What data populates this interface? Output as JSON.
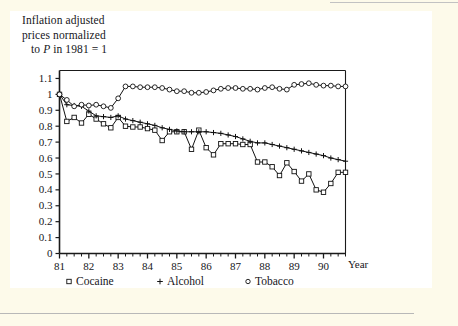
{
  "figure": {
    "axis_title_line1": "Inflation adjusted",
    "axis_title_line2": "prices normalized",
    "axis_title_line3_pre": "to ",
    "axis_title_line3_var": "P",
    "axis_title_line3_post": " in 1981 = 1",
    "x_axis_caption": "Year"
  },
  "colors": {
    "page_border": "#fdfaea",
    "page": "#ffffff",
    "ink": "#16161a",
    "line": "#111111",
    "rule": "#b8b8b8"
  },
  "chart_data": {
    "type": "line",
    "title": "Inflation adjusted prices normalized to P in 1981 = 1",
    "xlabel": "Year",
    "ylabel": "Inflation adjusted prices normalized to P in 1981 = 1",
    "xlim": [
      1981.0,
      1990.75
    ],
    "ylim": [
      0,
      1.15
    ],
    "yticks": [
      0,
      0.1,
      0.2,
      0.3,
      0.4,
      0.5,
      0.6,
      0.7,
      0.8,
      0.9,
      1,
      1.1
    ],
    "ytick_labels": [
      "0",
      "0.1",
      "0.2",
      "0.3",
      "0.4",
      "0.5",
      "0.6",
      "0.7",
      "0.8",
      "0.9",
      "1",
      "1.1"
    ],
    "xticks": [
      1981,
      1982,
      1983,
      1984,
      1985,
      1986,
      1987,
      1988,
      1989,
      1990
    ],
    "xtick_labels": [
      "81",
      "82",
      "83",
      "84",
      "85",
      "86",
      "87",
      "88",
      "89",
      "90"
    ],
    "minor_xticks_per_year": 4,
    "grid": false,
    "legend_position": "below-axis",
    "x": [
      1981.0,
      1981.25,
      1981.5,
      1981.75,
      1982.0,
      1982.25,
      1982.5,
      1982.75,
      1983.0,
      1983.25,
      1983.5,
      1983.75,
      1984.0,
      1984.25,
      1984.5,
      1984.75,
      1985.0,
      1985.25,
      1985.5,
      1985.75,
      1986.0,
      1986.25,
      1986.5,
      1986.75,
      1987.0,
      1987.25,
      1987.5,
      1987.75,
      1988.0,
      1988.25,
      1988.5,
      1988.75,
      1989.0,
      1989.25,
      1989.5,
      1989.75,
      1990.0,
      1990.25,
      1990.5,
      1990.75
    ],
    "series": [
      {
        "name": "Cocaine",
        "marker": "square",
        "values": [
          1.0,
          0.83,
          0.855,
          0.82,
          0.875,
          0.845,
          0.815,
          0.79,
          0.855,
          0.8,
          0.795,
          0.795,
          0.785,
          0.775,
          0.71,
          0.765,
          0.765,
          0.765,
          0.655,
          0.775,
          0.665,
          0.62,
          0.69,
          0.69,
          0.69,
          0.685,
          0.685,
          0.575,
          0.575,
          0.545,
          0.49,
          0.57,
          0.515,
          0.455,
          0.5,
          0.4,
          0.385,
          0.44,
          0.51,
          0.51
        ]
      },
      {
        "name": "Alcohol",
        "marker": "plus",
        "values": [
          1.0,
          0.935,
          0.93,
          0.925,
          0.895,
          0.865,
          0.86,
          0.855,
          0.865,
          0.845,
          0.835,
          0.825,
          0.815,
          0.805,
          0.79,
          0.78,
          0.77,
          0.765,
          0.765,
          0.765,
          0.765,
          0.76,
          0.755,
          0.745,
          0.735,
          0.72,
          0.705,
          0.695,
          0.695,
          0.685,
          0.675,
          0.665,
          0.655,
          0.645,
          0.635,
          0.625,
          0.615,
          0.6,
          0.59,
          0.58
        ]
      },
      {
        "name": "Tobacco",
        "marker": "circle",
        "values": [
          1.0,
          0.965,
          0.925,
          0.935,
          0.93,
          0.935,
          0.925,
          0.915,
          0.975,
          1.05,
          1.05,
          1.045,
          1.045,
          1.045,
          1.04,
          1.03,
          1.02,
          1.02,
          1.01,
          1.01,
          1.015,
          1.025,
          1.035,
          1.04,
          1.04,
          1.035,
          1.035,
          1.03,
          1.04,
          1.045,
          1.035,
          1.03,
          1.06,
          1.065,
          1.07,
          1.06,
          1.055,
          1.055,
          1.05,
          1.05
        ]
      }
    ]
  },
  "legend": [
    {
      "marker": "square",
      "label": "Cocaine"
    },
    {
      "marker": "plus",
      "label": "Alcohol"
    },
    {
      "marker": "circle",
      "label": "Tobacco"
    }
  ]
}
